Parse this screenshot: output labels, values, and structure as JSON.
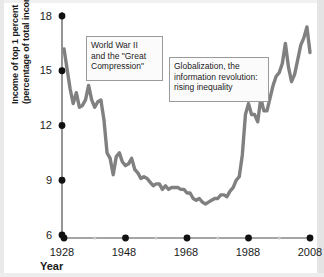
{
  "figure": {
    "background_color": "#ffffff",
    "line_color": "#808080",
    "tick_dot_color": "#111111",
    "minor_tick_dot_color": "#c6c6c6",
    "axis_color": "#4d4d4d",
    "annotation_border_color": "#9a9a9a",
    "annotation_fill_color": "#fbfbfb"
  },
  "axes": {
    "y_label_lines": [
      "Income of top 1 percent",
      "(percentage of total income)"
    ],
    "x_label": "Year",
    "y_ticks": [
      "18",
      "15",
      "12",
      "9",
      "6"
    ],
    "x_ticks": [
      "1928",
      "1948",
      "1968",
      "1988",
      "2008"
    ]
  },
  "annotations": {
    "ww2": {
      "lines": [
        "World War II",
        "and the \"Great",
        "Compression\""
      ]
    },
    "globalization": {
      "lines": [
        "Globalization, the",
        "information revolution:",
        "rising inequality"
      ]
    }
  },
  "chart_data": {
    "type": "line",
    "title": "",
    "subtitle": "",
    "xlabel": "Year",
    "ylabel": "Income of top 1 percent (percentage of total income)",
    "xlim": [
      1928,
      2008
    ],
    "ylim": [
      6,
      18
    ],
    "y_ticks": [
      6,
      9,
      12,
      15,
      18
    ],
    "x_ticks": [
      1928,
      1948,
      1968,
      1988,
      2008
    ],
    "x_minor_ticks": [
      1938,
      1958,
      1978,
      1998
    ],
    "grid": false,
    "legend": null,
    "legend_position": "none",
    "series": [
      {
        "name": "Income share of top 1 percent",
        "color": "#808080",
        "x": [
          1928,
          1929,
          1930,
          1931,
          1932,
          1933,
          1934,
          1935,
          1936,
          1937,
          1938,
          1939,
          1940,
          1941,
          1942,
          1943,
          1944,
          1945,
          1946,
          1947,
          1948,
          1949,
          1950,
          1951,
          1952,
          1953,
          1954,
          1955,
          1956,
          1957,
          1958,
          1959,
          1960,
          1961,
          1962,
          1963,
          1964,
          1965,
          1966,
          1967,
          1968,
          1969,
          1970,
          1971,
          1972,
          1973,
          1974,
          1975,
          1976,
          1977,
          1978,
          1979,
          1980,
          1981,
          1982,
          1983,
          1984,
          1985,
          1986,
          1987,
          1988,
          1989,
          1990,
          1991,
          1992,
          1993,
          1994,
          1995,
          1996,
          1997,
          1998,
          1999,
          2000,
          2001,
          2002,
          2003,
          2004,
          2005,
          2006,
          2007,
          2008
        ],
        "y": [
          16.2,
          15.1,
          14.0,
          13.2,
          13.8,
          13.0,
          13.1,
          13.4,
          14.2,
          13.4,
          13.0,
          13.3,
          13.4,
          12.3,
          10.5,
          10.2,
          9.3,
          10.3,
          10.5,
          10.0,
          9.8,
          9.9,
          10.2,
          9.6,
          9.4,
          9.1,
          9.2,
          9.1,
          8.9,
          8.7,
          8.8,
          8.8,
          8.5,
          8.7,
          8.5,
          8.6,
          8.6,
          8.6,
          8.5,
          8.5,
          8.3,
          8.3,
          8.0,
          7.9,
          8.0,
          7.8,
          7.7,
          7.8,
          7.9,
          8.0,
          8.0,
          8.2,
          8.2,
          8.1,
          8.4,
          8.6,
          9.0,
          9.2,
          10.4,
          12.6,
          13.2,
          12.6,
          12.6,
          12.2,
          13.5,
          12.8,
          12.8,
          13.5,
          14.2,
          14.7,
          14.9,
          15.4,
          16.5,
          15.2,
          14.4,
          14.8,
          15.6,
          16.4,
          16.8,
          17.4,
          16.0
        ]
      }
    ]
  }
}
